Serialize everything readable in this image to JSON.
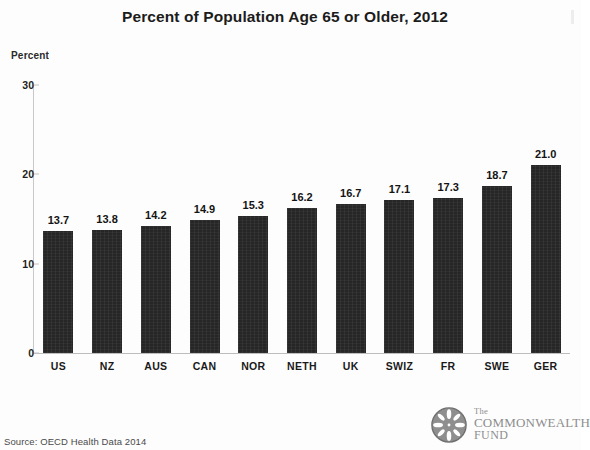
{
  "chart_data": {
    "type": "bar",
    "title": "Percent of Population Age 65 or Older, 2012",
    "xlabel": "",
    "ylabel": "Percent",
    "ylim": [
      0,
      30
    ],
    "yticks": [
      0,
      10,
      20,
      30
    ],
    "grid": false,
    "legend": "none",
    "bar_color": "#262626",
    "categories": [
      "US",
      "NZ",
      "AUS",
      "CAN",
      "NOR",
      "NETH",
      "UK",
      "SWIZ",
      "FR",
      "SWE",
      "GER"
    ],
    "values": [
      13.7,
      13.8,
      14.2,
      14.9,
      15.3,
      16.2,
      16.7,
      17.1,
      17.3,
      18.7,
      21.0
    ],
    "value_labels": [
      "13.7",
      "13.8",
      "14.2",
      "14.9",
      "15.3",
      "16.2",
      "16.7",
      "17.1",
      "17.3",
      "18.7",
      "21.0"
    ],
    "ytick_labels": [
      "0",
      "10",
      "20",
      "30"
    ]
  },
  "footer": {
    "source": "Source: OECD Health Data 2014",
    "logo": {
      "line1": "The",
      "line2": "COMMONWEALTH",
      "line3": "FUND",
      "mark": "commonwealth-fund-emblem"
    }
  }
}
